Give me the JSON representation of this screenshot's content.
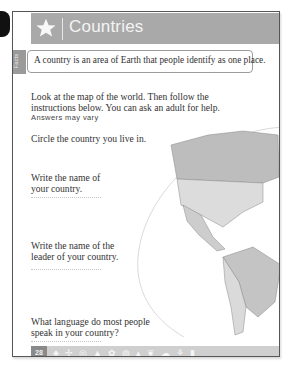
{
  "header": {
    "title": "Countries",
    "icon": "star-icon"
  },
  "side_tab": {
    "label": "Facts"
  },
  "definition": "A country is an area of Earth that people identify as one place.",
  "intro": "Look at the map of the world. Then follow the instructions below. You can ask an adult for help.",
  "answer_note": "Answers may vary",
  "questions": [
    {
      "text": "Circle the country you live in."
    },
    {
      "text": "Write the name of your country."
    },
    {
      "text": "Write the name of the leader of your country."
    },
    {
      "text": "What language do most people speak in your country?"
    }
  ],
  "map": {
    "label": "World map of the Americas"
  },
  "footer": {
    "page_number": "28",
    "icons": [
      "tree",
      "pinwheel",
      "compass",
      "rocket",
      "flower",
      "globe",
      "boat",
      "leaf",
      "cloud",
      "plant",
      "drop"
    ]
  },
  "colors": {
    "header_bg": "#a9a9a9",
    "footer_bg": "#cfcfcf",
    "page_num_bg": "#8a8a8a"
  }
}
